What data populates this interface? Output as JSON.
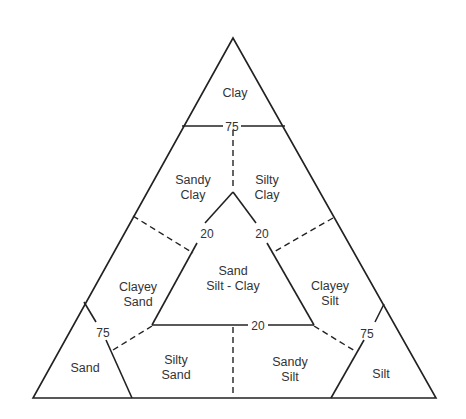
{
  "diagram": {
    "type": "soil-texture-ternary",
    "regions": {
      "clay": {
        "line1": "Clay"
      },
      "sandy_clay": {
        "line1": "Sandy",
        "line2": "Clay"
      },
      "silty_clay": {
        "line1": "Silty",
        "line2": "Clay"
      },
      "clayey_sand": {
        "line1": "Clayey",
        "line2": "Sand"
      },
      "sand_silt_clay": {
        "line1": "Sand",
        "line2": "Silt - Clay"
      },
      "clayey_silt": {
        "line1": "Clayey",
        "line2": "Silt"
      },
      "sand": {
        "line1": "Sand"
      },
      "silty_sand": {
        "line1": "Silty",
        "line2": "Sand"
      },
      "sandy_silt": {
        "line1": "Sandy",
        "line2": "Silt"
      },
      "silt": {
        "line1": "Silt"
      }
    },
    "thresholds": {
      "top_75": "75",
      "left_20": "20",
      "right_20": "20",
      "bottom_20": "20",
      "left_75": "75",
      "right_75": "75"
    }
  }
}
